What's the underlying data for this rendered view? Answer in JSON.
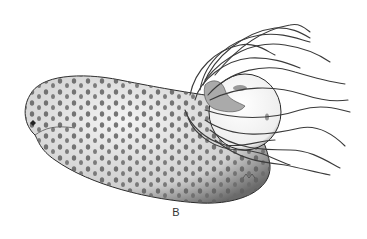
{
  "figure": {
    "panel_label": "B",
    "colors": {
      "ink": "#2a2a2a",
      "spots": "#555555",
      "background": "#ffffff"
    }
  }
}
